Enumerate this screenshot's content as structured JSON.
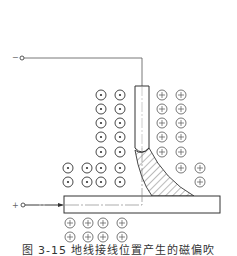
{
  "diagram": {
    "type": "welding magnetic arc blow diagram",
    "terminals": {
      "negative": {
        "label": "−",
        "position": "top-left, connected to electrode"
      },
      "positive": {
        "label": "+",
        "position": "left, connected to workpiece (ground)"
      }
    },
    "components": [
      "vertical electrode (rod)",
      "horizontal workpiece plate",
      "hatched arc column deflected toward right",
      "magnetic field symbols: dot-in-circle (out of page) on left side, plus-in-circle (into page) on right side and under plate"
    ],
    "field_symbols": {
      "dot_left_of_electrode_rows": 5,
      "dot_left_of_electrode_cols": 2,
      "dot_extra_left_rows": 2,
      "plus_right_of_electrode_rows": 5,
      "plus_below_plate_rows": 2,
      "plus_below_plate_cols": 4
    }
  },
  "caption": "图 3-15  地线接线位置产生的磁偏吹"
}
